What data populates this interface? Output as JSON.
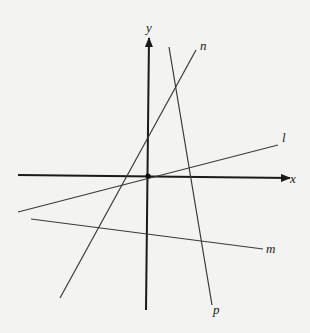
{
  "diagram": {
    "type": "coordinate-plane-lines",
    "background": "#f3f3f1",
    "stroke_color": "#2a2a2a",
    "axes": {
      "x": {
        "label": "x",
        "from": [
          18,
          175
        ],
        "to": [
          290,
          178
        ]
      },
      "y": {
        "label": "y",
        "from": [
          146,
          310
        ],
        "to": [
          149,
          38
        ]
      },
      "origin": [
        148,
        176
      ]
    },
    "lines": [
      {
        "name": "l",
        "label": "l",
        "from": [
          18,
          212
        ],
        "to": [
          278,
          145
        ]
      },
      {
        "name": "m",
        "label": "m",
        "from": [
          31,
          219
        ],
        "to": [
          263,
          249
        ]
      },
      {
        "name": "n",
        "label": "n",
        "from": [
          60,
          298
        ],
        "to": [
          196,
          50
        ]
      },
      {
        "name": "p",
        "label": "p",
        "from": [
          169,
          47
        ],
        "to": [
          212,
          305
        ]
      }
    ],
    "labels": {
      "x": "x",
      "y": "y",
      "l": "l",
      "m": "m",
      "n": "n",
      "p": "p"
    }
  }
}
